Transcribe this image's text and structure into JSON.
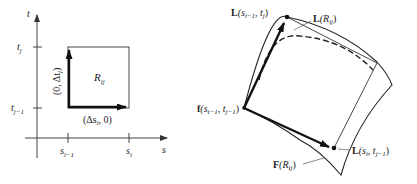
{
  "left_panel": {
    "axes": {
      "vertical_label": "t",
      "horizontal_label": "s"
    },
    "ticks": {
      "t_top": {
        "base": "t",
        "sub": "j"
      },
      "t_bottom": {
        "base": "t",
        "sub": "j−1"
      },
      "s_left": {
        "base": "s",
        "sub": "i−1"
      },
      "s_right": {
        "base": "s",
        "sub": "i"
      }
    },
    "region_label": {
      "base": "R",
      "sub": "ij"
    },
    "vector_vertical": "(0, Δt",
    "vector_vertical_sub": "j",
    "vector_vertical_close": ")",
    "vector_horizontal": "(Δs",
    "vector_horizontal_sub": "i",
    "vector_horizontal_close": ", 0)"
  },
  "right_panel": {
    "label_L_top": {
      "func": "L",
      "open": "(s",
      "sub1": "i−1",
      "mid": ", t",
      "sub2": "j",
      "close": ")"
    },
    "label_L_R": {
      "func": "L",
      "open": "(R",
      "sub": "ij",
      "close": ")"
    },
    "label_f": {
      "func": "f",
      "open": "(s",
      "sub1": "i−1",
      "mid": ", t",
      "sub2": "j−1",
      "close": ")"
    },
    "label_F_R": {
      "func": "F",
      "open": "(R",
      "sub": "ij",
      "close": ")"
    },
    "label_L_bottom": {
      "func": "L",
      "open": "(s",
      "sub1": "i",
      "mid": ", t",
      "sub2": "j−1",
      "close": ")"
    }
  },
  "colors": {
    "ink": "#222222",
    "axis": "#444444",
    "background": "#ffffff"
  }
}
